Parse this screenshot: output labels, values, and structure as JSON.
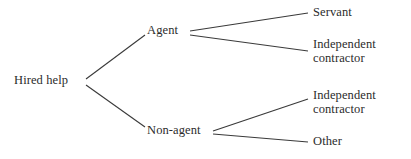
{
  "diagram": {
    "type": "tree",
    "orientation": "left-to-right",
    "background_color": "#ffffff",
    "line_color": "#3a3a3a",
    "text_color": "#2b2b2b",
    "nodes": {
      "root": {
        "label": "Hired help"
      },
      "agent": {
        "label": "Agent"
      },
      "non_agent": {
        "label": "Non-agent"
      },
      "servant": {
        "label": "Servant"
      },
      "independent_contractor_agent": {
        "line1": "Independent",
        "line2": "contractor"
      },
      "independent_contractor_non_agent": {
        "line1": "Independent",
        "line2": "contractor"
      },
      "other": {
        "label": "Other"
      }
    },
    "edges": [
      {
        "from": "Hired help",
        "to": "Agent"
      },
      {
        "from": "Hired help",
        "to": "Non-agent"
      },
      {
        "from": "Agent",
        "to": "Servant"
      },
      {
        "from": "Agent",
        "to": "Independent contractor"
      },
      {
        "from": "Non-agent",
        "to": "Independent contractor"
      },
      {
        "from": "Non-agent",
        "to": "Other"
      }
    ]
  }
}
